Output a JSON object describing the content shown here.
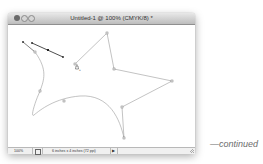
{
  "window": {
    "title": "Untitled-1 @ 100% (CMYK/8) *",
    "buttons": [
      "close",
      "minimize",
      "zoom"
    ]
  },
  "canvas": {
    "path_color": "#9a9a9a",
    "anchor_color": "#555555",
    "active_color": "#222222",
    "cursor": "pen-add-anchor-cursor"
  },
  "statusbar": {
    "zoom_level": "100%",
    "doc_info": "6 inches x 4 inches (72 ppi)",
    "arrow": "▶"
  },
  "caption": {
    "text": "—continued"
  }
}
